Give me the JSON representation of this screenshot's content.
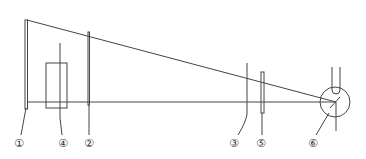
{
  "diagram": {
    "type": "optical-setup-schematic",
    "colors": {
      "line": "#444444",
      "background": "#ffffff"
    },
    "components": [
      {
        "id": "1",
        "label": "①",
        "description": "plate / screen (left)"
      },
      {
        "id": "2",
        "label": "②",
        "description": "vertical lens / plate"
      },
      {
        "id": "3",
        "label": "③",
        "description": "vertical element"
      },
      {
        "id": "4",
        "label": "④",
        "description": "rectangular block"
      },
      {
        "id": "5",
        "label": "⑤",
        "description": "thin plate"
      },
      {
        "id": "6",
        "label": "⑥",
        "description": "circular source with tube"
      }
    ]
  }
}
